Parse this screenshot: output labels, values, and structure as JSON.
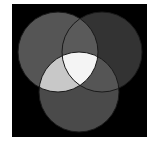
{
  "diagram": {
    "type": "venn",
    "background": "#000000",
    "frame": {
      "x": 12,
      "y": 4,
      "width": 135,
      "height": 133
    },
    "circles": [
      {
        "name": "top-left",
        "cx": 58,
        "cy": 52,
        "r": 40,
        "fill": "#555555"
      },
      {
        "name": "top-right",
        "cx": 102,
        "cy": 52,
        "r": 40,
        "fill": "#333333"
      },
      {
        "name": "bottom",
        "cx": 79,
        "cy": 92,
        "r": 40,
        "fill": "#4a4a4a"
      }
    ],
    "regions": {
      "top_left_and_top_right": "#5a5a5a",
      "top_left_and_bottom": "#c8c8c8",
      "top_right_and_bottom": "#555555",
      "all_three": "#f4f4f4"
    },
    "stroke": "#1a1a1a"
  }
}
